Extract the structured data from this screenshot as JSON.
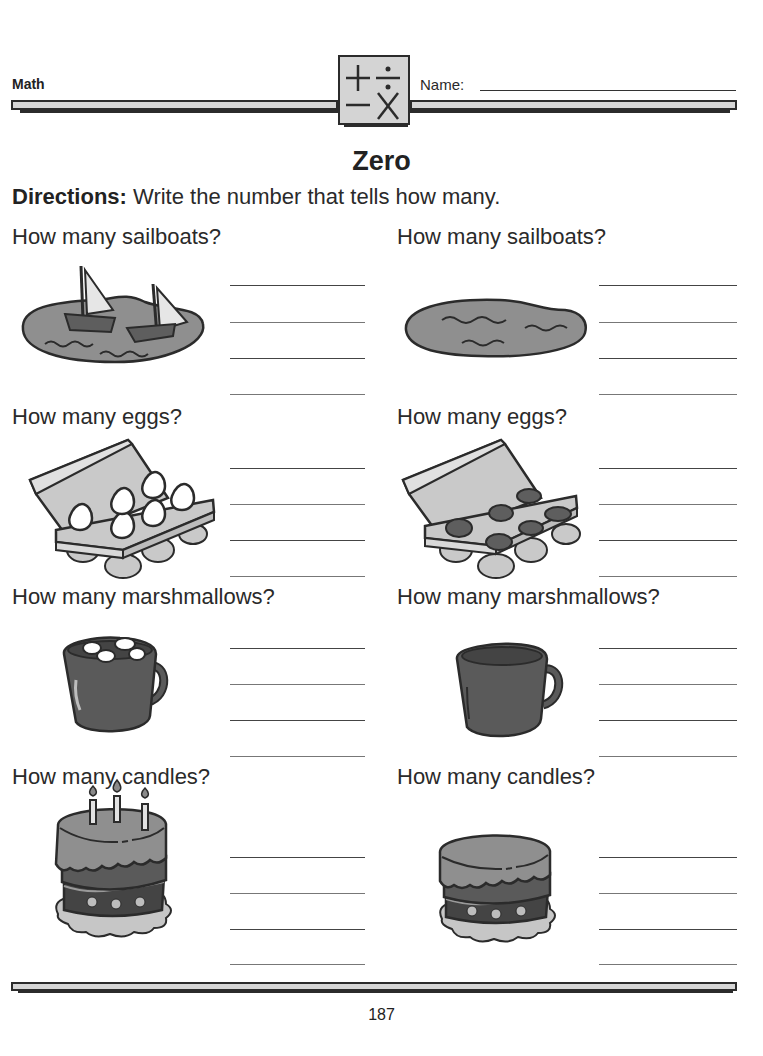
{
  "header": {
    "subject": "Math",
    "logo_symbols": [
      "+",
      "÷",
      "−",
      "×"
    ],
    "name_label": "Name:",
    "name_value": ""
  },
  "worksheet": {
    "title": "Zero",
    "directions_label": "Directions:",
    "directions_text": " Write the number that tells how many.",
    "rows": [
      {
        "left": {
          "question": "How many sailboats?",
          "picture": "lake-with-two-sailboats-icon",
          "count_shown": 2,
          "answer": ""
        },
        "right": {
          "question": "How many sailboats?",
          "picture": "empty-lake-icon",
          "count_shown": 0,
          "answer": ""
        }
      },
      {
        "left": {
          "question": "How many eggs?",
          "picture": "egg-carton-with-six-eggs-icon",
          "count_shown": 6,
          "answer": ""
        },
        "right": {
          "question": "How many eggs?",
          "picture": "empty-egg-carton-icon",
          "count_shown": 0,
          "answer": ""
        }
      },
      {
        "left": {
          "question": "How many marshmallows?",
          "picture": "mug-with-four-marshmallows-icon",
          "count_shown": 4,
          "answer": ""
        },
        "right": {
          "question": "How many marshmallows?",
          "picture": "empty-mug-icon",
          "count_shown": 0,
          "answer": ""
        }
      },
      {
        "left": {
          "question": "How many candles?",
          "picture": "cake-with-three-candles-icon",
          "count_shown": 3,
          "answer": ""
        },
        "right": {
          "question": "How many candles?",
          "picture": "cake-without-candles-icon",
          "count_shown": 0,
          "answer": ""
        }
      }
    ]
  },
  "footer": {
    "page_number": "187"
  },
  "colors": {
    "ink": "#2b2b2b",
    "light_gray": "#d6d6d6",
    "mid_gray": "#8a8a8a",
    "dark_gray": "#5a5a5a"
  }
}
